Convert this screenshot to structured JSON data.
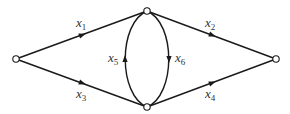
{
  "diagram": {
    "type": "directed-network",
    "nodes": [
      {
        "id": "source",
        "x": 16,
        "y": 59
      },
      {
        "id": "top",
        "x": 147,
        "y": 11
      },
      {
        "id": "bottom",
        "x": 147,
        "y": 107
      },
      {
        "id": "sink",
        "x": 276,
        "y": 59
      }
    ],
    "edges": [
      {
        "id": "x1",
        "var": "x",
        "sub": "1",
        "from": "source",
        "to": "top"
      },
      {
        "id": "x2",
        "var": "x",
        "sub": "2",
        "from": "top",
        "to": "sink"
      },
      {
        "id": "x3",
        "var": "x",
        "sub": "3",
        "from": "source",
        "to": "bottom"
      },
      {
        "id": "x4",
        "var": "x",
        "sub": "4",
        "from": "bottom",
        "to": "sink"
      },
      {
        "id": "x5",
        "var": "x",
        "sub": "5",
        "from": "bottom",
        "to": "top"
      },
      {
        "id": "x6",
        "var": "x",
        "sub": "6",
        "from": "top",
        "to": "bottom"
      }
    ],
    "labels": {
      "x1": {
        "var": "x",
        "sub": "1"
      },
      "x2": {
        "var": "x",
        "sub": "2"
      },
      "x3": {
        "var": "x",
        "sub": "3"
      },
      "x4": {
        "var": "x",
        "sub": "4"
      },
      "x5": {
        "var": "x",
        "sub": "5"
      },
      "x6": {
        "var": "x",
        "sub": "6"
      }
    },
    "colors": {
      "stroke": "#1a1a1a",
      "label": "#333333",
      "background": "#ffffff"
    }
  }
}
